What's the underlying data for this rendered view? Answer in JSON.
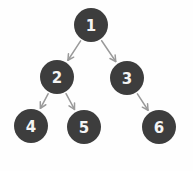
{
  "diagram": {
    "kind": "binary-tree",
    "canvas": {
      "width": 193,
      "height": 171,
      "background": "#fefefe"
    },
    "style": {
      "node_fill": "#3d3d3d",
      "node_label_color": "#f4f4f4",
      "edge_color": "#9a9a9a",
      "node_radius": 17
    },
    "nodes": [
      {
        "id": "n1",
        "label": "1",
        "cx": 91,
        "cy": 25,
        "r": 17,
        "level": 0
      },
      {
        "id": "n2",
        "label": "2",
        "cx": 57,
        "cy": 77,
        "r": 17,
        "level": 1
      },
      {
        "id": "n3",
        "label": "3",
        "cx": 127,
        "cy": 78,
        "r": 17,
        "level": 1
      },
      {
        "id": "n4",
        "label": "4",
        "cx": 31,
        "cy": 126,
        "r": 17,
        "level": 2
      },
      {
        "id": "n5",
        "label": "5",
        "cx": 84,
        "cy": 127,
        "r": 17,
        "level": 2
      },
      {
        "id": "n6",
        "label": "6",
        "cx": 159,
        "cy": 127,
        "r": 17,
        "level": 2
      }
    ],
    "edges": [
      {
        "id": "e1",
        "from": "n1",
        "to": "n2",
        "directed": true
      },
      {
        "id": "e2",
        "from": "n1",
        "to": "n3",
        "directed": true
      },
      {
        "id": "e3",
        "from": "n2",
        "to": "n4",
        "directed": true
      },
      {
        "id": "e4",
        "from": "n2",
        "to": "n5",
        "directed": true
      },
      {
        "id": "e5",
        "from": "n3",
        "to": "n6",
        "directed": true
      }
    ]
  }
}
